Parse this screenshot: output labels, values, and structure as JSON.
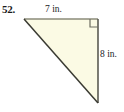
{
  "figure": {
    "problem_number": "52.",
    "background_color": "#ffffff",
    "shape": {
      "name": "right-triangle",
      "fill_color": "#FBFAE4",
      "stroke_color": "#3a3a32",
      "top_edge_color": "#8b8b7a",
      "vertices": {
        "top_left": [
          24,
          19
        ],
        "top_right": [
          98,
          19
        ],
        "bottom_right": [
          98,
          103
        ]
      },
      "right_angle_marker": {
        "name": "right-angle-square",
        "at_vertex": "top_right",
        "size": 8,
        "color": "#6e6e62"
      }
    },
    "labels": {
      "top_side": "7 in.",
      "right_side": "8 in."
    }
  }
}
